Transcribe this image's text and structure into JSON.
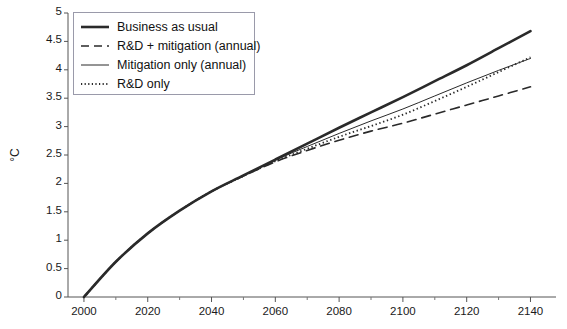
{
  "chart_data": {
    "type": "line",
    "title": "",
    "xlabel": "",
    "ylabel": "°C",
    "xlim": [
      1995,
      2148
    ],
    "ylim": [
      0,
      5
    ],
    "grid": false,
    "legend_position": "top-left",
    "xticks": [
      2000,
      2020,
      2040,
      2060,
      2080,
      2100,
      2120,
      2140
    ],
    "xtick_labels": [
      "2000",
      "2020",
      "2040",
      "2060",
      "2080",
      "2100",
      "2120",
      "2140"
    ],
    "x_minor_ticks": [
      2010,
      2030,
      2050,
      2070,
      2090,
      2110,
      2130
    ],
    "yticks": [
      0,
      0.5,
      1,
      1.5,
      2,
      2.5,
      3,
      3.5,
      4,
      4.5,
      5
    ],
    "ytick_labels": [
      "0",
      "0.5",
      "1",
      "1.5",
      "2",
      "2.5",
      "3",
      "3.5",
      "4",
      "4.5",
      "5"
    ],
    "x": [
      2000,
      2010,
      2020,
      2030,
      2040,
      2050,
      2060,
      2070,
      2080,
      2090,
      2100,
      2110,
      2120,
      2130,
      2140
    ],
    "series": [
      {
        "name": "Business as usual",
        "style": "solid",
        "width": 2.6,
        "color": "#2a2a2a",
        "values": [
          0.0,
          0.62,
          1.12,
          1.52,
          1.86,
          2.14,
          2.42,
          2.7,
          2.98,
          3.25,
          3.52,
          3.8,
          4.08,
          4.38,
          4.68
        ]
      },
      {
        "name": "R&D + mitigation (annual)",
        "style": "dashed",
        "width": 1.6,
        "color": "#2a2a2a",
        "values": [
          0.0,
          0.62,
          1.12,
          1.52,
          1.86,
          2.13,
          2.38,
          2.58,
          2.76,
          2.92,
          3.06,
          3.22,
          3.38,
          3.54,
          3.7
        ]
      },
      {
        "name": "Mitigation only (annual)",
        "style": "solid",
        "width": 1.0,
        "color": "#2a2a2a",
        "values": [
          0.0,
          0.62,
          1.12,
          1.52,
          1.86,
          2.14,
          2.41,
          2.65,
          2.88,
          3.1,
          3.31,
          3.54,
          3.77,
          3.99,
          4.2
        ]
      },
      {
        "name": "R&D only",
        "style": "dotted",
        "width": 1.8,
        "color": "#2a2a2a",
        "values": [
          0.0,
          0.62,
          1.12,
          1.52,
          1.86,
          2.13,
          2.39,
          2.61,
          2.82,
          3.01,
          3.21,
          3.45,
          3.7,
          3.96,
          4.22
        ]
      }
    ]
  },
  "axes": {
    "y_title": "°C"
  },
  "legend": {
    "items": [
      {
        "label": "Business as usual"
      },
      {
        "label": "R&D + mitigation (annual)"
      },
      {
        "label": "Mitigation only (annual)"
      },
      {
        "label": "R&D only"
      }
    ]
  }
}
